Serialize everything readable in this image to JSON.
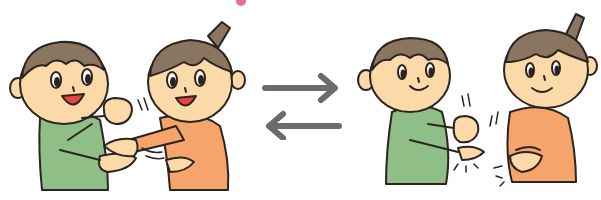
{
  "illustration": {
    "description": "Two children playing rock-paper-scissors (janken), shown in two scenes linked by bidirectional arrows",
    "left_scene": {
      "label": "Children throwing hands — boy shows rock, girl shows paper",
      "boy_expression": "laughing",
      "girl_expression": "laughing"
    },
    "right_scene": {
      "label": "Children shaking hands / clapping — boy makes fist, girl rubs hands",
      "boy_expression": "smiling",
      "girl_expression": "smiling"
    },
    "arrows": {
      "top": "right-arrow",
      "bottom": "left-arrow"
    }
  },
  "colors": {
    "skin": "#fbd9a8",
    "hair": "#8a7561",
    "boy_shirt": "#8fbf86",
    "girl_shirt": "#f5a46b",
    "outline": "#2b2420",
    "arrow": "#6b6b6b",
    "mouth": "#e7443f",
    "accent_pink": "#e46b9d"
  }
}
